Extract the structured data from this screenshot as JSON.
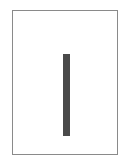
{
  "page": {
    "border_color": "#8a8a8a",
    "background": "#ffffff"
  },
  "content": {
    "glyph": "vertical-bar",
    "bar_color": "#4a4a4a"
  }
}
